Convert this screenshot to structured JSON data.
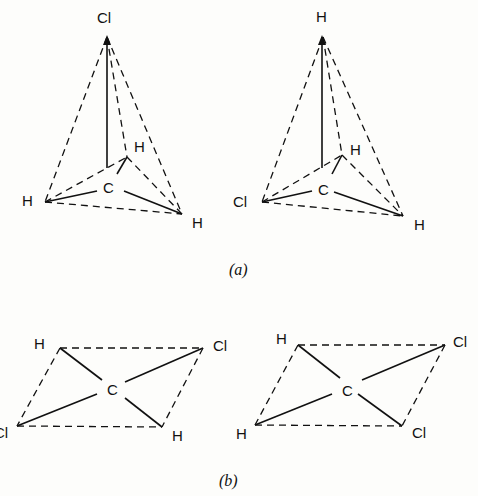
{
  "figure": {
    "a": {
      "caption": "(a)",
      "left": {
        "top": "Cl",
        "back": "H",
        "left": "H",
        "right": "H",
        "center": "C"
      },
      "right": {
        "top": "H",
        "back": "H",
        "left": "Cl",
        "right": "H",
        "center": "C"
      }
    },
    "b": {
      "caption": "(b)",
      "left": {
        "top_left": "H",
        "top_right": "Cl",
        "bottom_left": "Cl",
        "bottom_right": "H",
        "center": "C"
      },
      "right": {
        "top_left": "H",
        "top_right": "Cl",
        "bottom_left": "H",
        "bottom_right": "Cl",
        "center": "C"
      }
    }
  }
}
